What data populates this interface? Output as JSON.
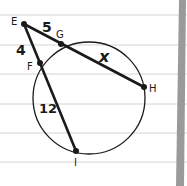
{
  "diagram": {
    "points": {
      "E": {
        "label": "E",
        "x": 24,
        "y": 24
      },
      "G": {
        "label": "G",
        "x": 61,
        "y": 44
      },
      "F": {
        "label": "F",
        "x": 40,
        "y": 63
      },
      "H": {
        "label": "H",
        "x": 144,
        "y": 87
      },
      "I": {
        "label": "I",
        "x": 76,
        "y": 151
      }
    },
    "segments": [
      {
        "from": "E",
        "to": "H",
        "length_label": "EG = 5, GH = x"
      },
      {
        "from": "E",
        "to": "I",
        "length_label": "EF = 4, FI = 12"
      }
    ],
    "length_labels": {
      "EG": "5",
      "GH": "x",
      "EF": "4",
      "FI": "12"
    },
    "circle": {
      "cx": 89,
      "cy": 98,
      "r": 56
    },
    "colors": {
      "ink": "#1a1a1a",
      "paper": "#ffffff",
      "ruled_line": "#d4d4d4",
      "margin_bar": "#9a9a9a"
    }
  }
}
